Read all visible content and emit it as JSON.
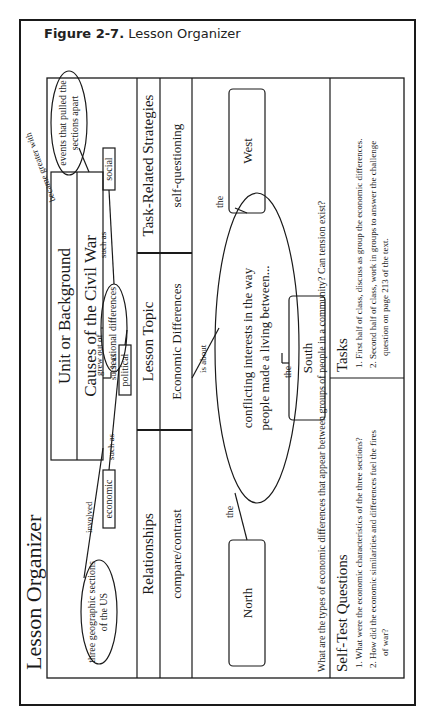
{
  "figure": {
    "label": "Figure 2-7.",
    "title": "Lesson Organizer"
  },
  "organizer": {
    "title": "Lesson Organizer",
    "unit": {
      "heading": "Unit or Background",
      "value": "Causes of the Civil War"
    },
    "concept_map_top": {
      "involved_label": "involved",
      "geographic_node": "three geographic sections of the US",
      "geographic_line1": "three geographic sections",
      "geographic_line2": "of the US",
      "grew_out_of_label": "grew out of",
      "sectional_node": "sectional differences",
      "such_as_1": "such as",
      "such_as_2": "such as",
      "such_as_3": "such as",
      "economic": "economic",
      "political": "political",
      "social": "social",
      "became_greater_with_label": "became greater with",
      "events_line1": "events that pulled the",
      "events_line2": "sections apart"
    },
    "relationships": {
      "heading": "Relationships",
      "value": "compare/contrast"
    },
    "lesson_topic": {
      "heading": "Lesson Topic",
      "value": "Economic Differences"
    },
    "strategies": {
      "heading": "Task-Related Strategies",
      "value": "self-questioning"
    },
    "concept_map_bottom": {
      "is_about_label": "is about",
      "center_line1": "conflicting interests in the way",
      "center_line2": "people made a living between...",
      "the_north": "the",
      "the_south": "the",
      "the_west": "the",
      "north": "North",
      "south": "South",
      "west": "West"
    },
    "challenge_question": "What are the types of economic differences that appear between groups of people in a community? Can tension exist?",
    "self_test": {
      "heading": "Self-Test Questions",
      "items": [
        "1. What were the economic characteristics of the three sections?",
        "2. How did the economic similarities and differences fuel the fires",
        "of war?"
      ]
    },
    "tasks": {
      "heading": "Tasks",
      "items": [
        "1. First half of class, discuss as group the economic differences.",
        "2. Second half of class, work in groups to answer the challenge",
        "question on  page 213 of the text."
      ]
    }
  },
  "colors": {
    "ink": "#1a1a1a",
    "paper": "#ffffff"
  }
}
